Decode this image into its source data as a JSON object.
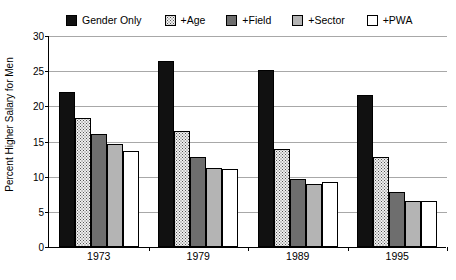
{
  "chart_data": {
    "type": "bar",
    "title": "",
    "xlabel": "",
    "ylabel": "Percent Higher Salary for Men",
    "ylim": [
      0,
      30
    ],
    "yticks": [
      0,
      5,
      10,
      15,
      20,
      25,
      30
    ],
    "grid": true,
    "legend_position": "top",
    "categories": [
      "1973",
      "1979",
      "1989",
      "1995"
    ],
    "series": [
      {
        "name": "Gender Only",
        "values": [
          22.0,
          26.5,
          25.2,
          21.6
        ],
        "color": "#111111",
        "pattern": "solid-black"
      },
      {
        "name": "+Age",
        "values": [
          18.3,
          16.5,
          14.0,
          12.8
        ],
        "color": "#efefef",
        "pattern": "dotted-light"
      },
      {
        "name": "+Field",
        "values": [
          16.0,
          12.8,
          9.6,
          7.8
        ],
        "color": "#6e6e6e",
        "pattern": "dark-gray"
      },
      {
        "name": "+Sector",
        "values": [
          14.6,
          11.2,
          8.9,
          6.6
        ],
        "color": "#b4b4b4",
        "pattern": "mid-gray"
      },
      {
        "name": "+PWA",
        "values": [
          13.7,
          11.1,
          9.2,
          6.6
        ],
        "color": "#ffffff",
        "pattern": "white"
      }
    ]
  },
  "legend": {
    "items": [
      {
        "label": "Gender Only"
      },
      {
        "label": "+Age"
      },
      {
        "label": "+Field"
      },
      {
        "label": "+Sector"
      },
      {
        "label": "+PWA"
      }
    ]
  },
  "axes": {
    "y_title": "Percent Higher Salary for Men",
    "y_tick_labels": [
      "30",
      "25",
      "20",
      "15",
      "10",
      "5",
      "0"
    ],
    "x_tick_labels": [
      "1973",
      "1979",
      "1989",
      "1995"
    ]
  }
}
